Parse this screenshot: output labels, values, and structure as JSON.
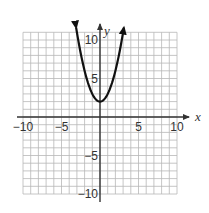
{
  "chart_data": {
    "type": "line",
    "title": "",
    "xlabel": "x",
    "ylabel": "y",
    "xlim": [
      -10,
      10
    ],
    "ylim": [
      -10,
      11
    ],
    "grid": true,
    "grid_step": 1,
    "legend": null,
    "x_tick_labels": [
      "−10",
      "−5",
      "5",
      "10"
    ],
    "x_ticks": [
      -10,
      -5,
      5,
      10
    ],
    "y_tick_labels": [
      "10",
      "5",
      "−5",
      "−10"
    ],
    "y_ticks": [
      10,
      5,
      -5,
      -10
    ],
    "series": [
      {
        "name": "y = x^2 + 2",
        "equation": "y = x^2 + 2",
        "vertex": [
          0,
          2
        ],
        "x": [
          -3.1,
          -3,
          -2.5,
          -2,
          -1.5,
          -1,
          -0.5,
          0,
          0.5,
          1,
          1.5,
          2,
          2.5,
          3,
          3.1
        ],
        "y": [
          11.61,
          11,
          8.25,
          6,
          4.25,
          3,
          2.25,
          2,
          2.25,
          3,
          4.25,
          6,
          8.25,
          11,
          11.61
        ],
        "arrows_on_ends": true
      }
    ]
  },
  "colors": {
    "curve": "#111111",
    "axis": "#333333",
    "grid": "#b8b8b8",
    "text": "#333333"
  }
}
